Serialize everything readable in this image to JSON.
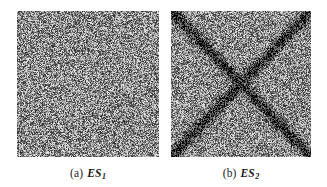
{
  "figure": {
    "background_color": "#ffffff",
    "width": 327,
    "height": 187,
    "panel_count": 2
  },
  "panels": [
    {
      "id": "ES1",
      "caption_index": "(a)",
      "caption_symbol": "ES",
      "caption_subscript": "1",
      "description": "uniform grayscale random noise texture",
      "pattern": "noise-only",
      "noise_mean": 140,
      "noise_spread": 95,
      "border_color": "#6f6f6f",
      "left": 17,
      "top": 11,
      "width": 142,
      "height": 146
    },
    {
      "id": "ES2",
      "caption_index": "(b)",
      "caption_symbol": "ES",
      "caption_subscript": "2",
      "description": "grayscale random noise texture overlaid with a dark X formed by two corner-to-corner diagonal bands crossing at the center",
      "pattern": "noise-with-diagonal-cross",
      "noise_mean": 140,
      "noise_spread": 95,
      "cross_darkness": 105,
      "cross_half_width": 5.0,
      "border_color": "#6f6f6f",
      "left": 171,
      "top": 11,
      "width": 140,
      "height": 146
    }
  ],
  "chart_data": {
    "type": "heatmap",
    "title": "",
    "xlabel": "",
    "ylabel": "",
    "grid": false,
    "legend_position": "none",
    "subplots": [
      {
        "label": "(a) ES1",
        "kind": "grayscale-noise-image",
        "value_range": [
          0,
          255
        ],
        "mean_intensity": 140,
        "std_intensity": 48,
        "structure": "none (isotropic salt-and-pepper noise)"
      },
      {
        "label": "(b) ES2",
        "kind": "grayscale-noise-image",
        "value_range": [
          0,
          255
        ],
        "mean_intensity": 140,
        "std_intensity": 48,
        "structure": "two dark diagonal bands from corner to corner forming an X, minimum intensity near 35 at the crossing center"
      }
    ]
  },
  "captions": {
    "a": {
      "index": "(a)",
      "symbol": "ES",
      "subscript": "1"
    },
    "b": {
      "index": "(b)",
      "symbol": "ES",
      "subscript": "2"
    }
  }
}
